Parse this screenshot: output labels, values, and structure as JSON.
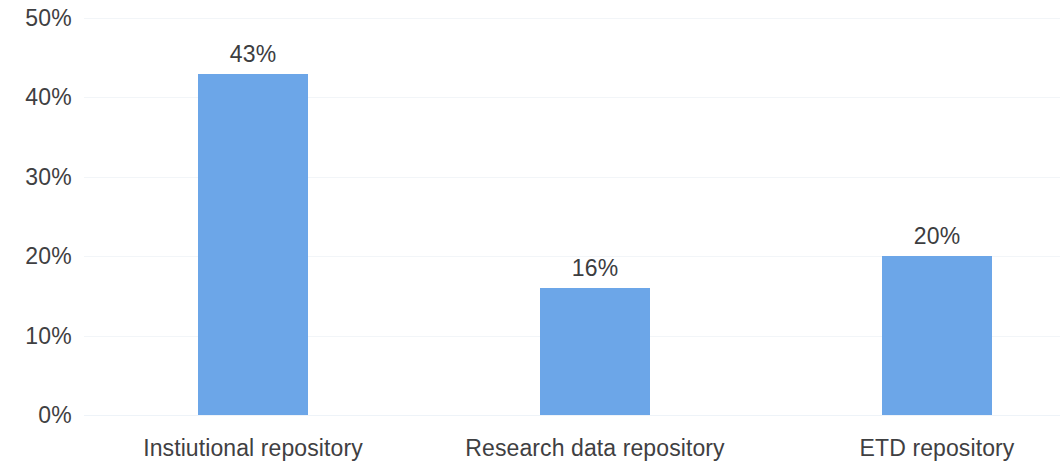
{
  "chart_data": {
    "type": "bar",
    "title": "",
    "subtitle": "",
    "xlabel": "",
    "ylabel": "",
    "categories": [
      "Instiutional repository",
      "Research data repository",
      "ETD repository"
    ],
    "values": [
      43,
      16,
      20
    ],
    "value_labels": [
      "43%",
      "16%",
      "20%"
    ],
    "ylim": [
      0,
      50
    ],
    "y_ticks": [
      50,
      40,
      30,
      20,
      10,
      0
    ],
    "y_tick_labels": [
      "50%",
      "40%",
      "30%",
      "20%",
      "10%",
      "0%"
    ],
    "grid": true,
    "legend": "none",
    "series": [
      {
        "name": "",
        "values": [
          43,
          16,
          20
        ]
      }
    ],
    "colors": {
      "bar": "#6ca6e8",
      "gridline": "#f2f5f8",
      "tick_text": "#3f4042",
      "value_text": "#3c3d3f",
      "background": "#ffffff"
    }
  }
}
